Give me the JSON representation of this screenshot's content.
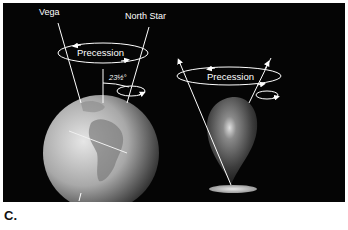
{
  "figure": {
    "caption": "C.",
    "earth_diagram": {
      "star_left": "Vega",
      "star_right": "North Star",
      "precession_label": "Precession",
      "tilt_angle_label": "23½°"
    },
    "top_diagram": {
      "precession_label": "Precession"
    },
    "colors": {
      "background": "#050505",
      "lines": "#ffffff",
      "top_body": "#6a6a6a",
      "earth": "#c8c8c8"
    }
  }
}
